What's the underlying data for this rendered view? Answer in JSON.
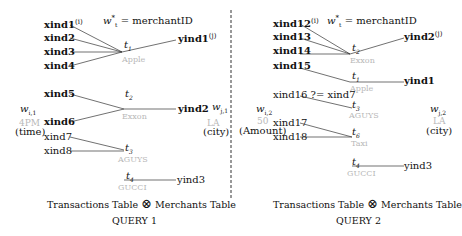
{
  "query1": {
    "title": "QUERY 1",
    "join_caption": {
      "left": "Transactions Table",
      "op": "⊗",
      "right": "Merchants Table"
    },
    "weight_label": "w",
    "weight_sup": "*",
    "weight_sub": "t",
    "weight_value": "= merchantID",
    "left_weight": {
      "w": "w",
      "sub": "i,1",
      "value": "4PM",
      "unit": "(time)"
    },
    "right_weight": {
      "w": "w",
      "sub": "j,1",
      "value": "LA",
      "unit": "(city)"
    },
    "groups": [
      {
        "t": "t",
        "t_sub": "1",
        "merchant": "Apple",
        "x": [
          "xind1",
          "xind2",
          "xind3",
          "xind4"
        ],
        "x_sup": "(i)",
        "y": "yind1",
        "y_sup": "(j)"
      },
      {
        "t": "t",
        "t_sub": "2",
        "merchant": "Exxon",
        "x": [
          "xind5",
          "xind6"
        ],
        "y": "yind2"
      },
      {
        "t": "t",
        "t_sub": "3",
        "merchant": "AGUYS",
        "x": [
          "xind7",
          "xind8"
        ],
        "y": ""
      },
      {
        "t": "t",
        "t_sub": "4",
        "merchant": "GUCCI",
        "x": [],
        "y": "yind3"
      }
    ]
  },
  "query2": {
    "title": "QUERY 2",
    "join_caption": {
      "left": "Transactions Table",
      "op": "⊗",
      "right": "Merchants Table"
    },
    "weight_label": "w",
    "weight_sup": "*",
    "weight_sub": "t",
    "weight_value": "= merchantID",
    "left_weight": {
      "w": "w",
      "sub": "i,2",
      "value": "50",
      "unit": "(Amount)"
    },
    "right_weight": {
      "w": "w",
      "sub": "j,2",
      "value": "LA",
      "unit": "(city)"
    },
    "comparison": "xind16 ?= xind7",
    "groups": [
      {
        "t": "t",
        "t_sub": "2",
        "merchant": "Exxon",
        "x": [
          "xind12",
          "xind13",
          "xind14"
        ],
        "x_sup": "(i)",
        "y": "yind2",
        "y_sup": "(j)"
      },
      {
        "t": "t",
        "t_sub": "1",
        "merchant": "Apple",
        "x": [
          "xind15"
        ],
        "y": "yind1"
      },
      {
        "t": "t",
        "t_sub": "3",
        "merchant": "AGUYS",
        "x": [
          "xind16"
        ],
        "y": ""
      },
      {
        "t": "t",
        "t_sub": "6",
        "merchant": "Taxi",
        "x": [
          "xind17",
          "xind18"
        ],
        "y": ""
      },
      {
        "t": "t",
        "t_sub": "4",
        "merchant": "GUCCI",
        "x": [],
        "y": "yind3"
      }
    ]
  }
}
